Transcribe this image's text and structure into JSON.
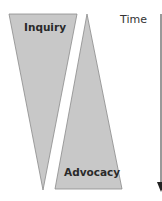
{
  "diagram": {
    "shapes": [
      {
        "name": "inquiry",
        "label": "Inquiry",
        "orientation": "wide-top"
      },
      {
        "name": "advocacy",
        "label": "Advocacy",
        "orientation": "wide-bottom"
      }
    ],
    "axis": {
      "label": "Time",
      "direction": "down"
    },
    "colors": {
      "fill": "#c8c8c8",
      "stroke": "#8a8a8a",
      "text": "#2a2a2a"
    }
  }
}
